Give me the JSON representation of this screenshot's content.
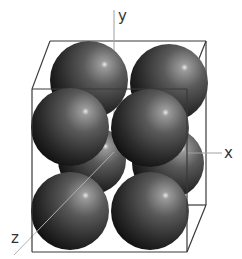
{
  "diagram": {
    "type": "crystal-lattice-unit-cell",
    "axes": {
      "x": "x",
      "y": "y",
      "z": "z"
    },
    "colors": {
      "sphere_dark": "#151515",
      "sphere_mid": "#5a5a5a",
      "sphere_highlight": "#e8e8e8",
      "box_edge": "#3a3a3a",
      "axis_line": "#a0a0a0"
    },
    "sphere_count_visible": 8
  }
}
